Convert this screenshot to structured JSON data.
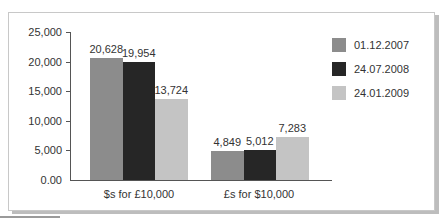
{
  "chart_data": {
    "type": "bar",
    "title": "",
    "xlabel": "",
    "ylabel": "",
    "ylim": [
      0,
      25000
    ],
    "yticks": [
      "0.00",
      "5,000",
      "10,000",
      "15,000",
      "20,000",
      "25,000"
    ],
    "categories": [
      "$s for £10,000",
      "£s for $10,000"
    ],
    "series": [
      {
        "name": "01.12.2007",
        "color": "#8c8c8c",
        "values": [
          20628,
          4849
        ],
        "labels": [
          "20,628",
          "4,849"
        ]
      },
      {
        "name": "24.07.2008",
        "color": "#262626",
        "values": [
          19954,
          5012
        ],
        "labels": [
          "19,954",
          "5,012"
        ]
      },
      {
        "name": "24.01.2009",
        "color": "#c4c4c4",
        "values": [
          13724,
          7283
        ],
        "labels": [
          "13,724",
          "7,283"
        ]
      }
    ],
    "grid": false,
    "legend_position": "right"
  }
}
